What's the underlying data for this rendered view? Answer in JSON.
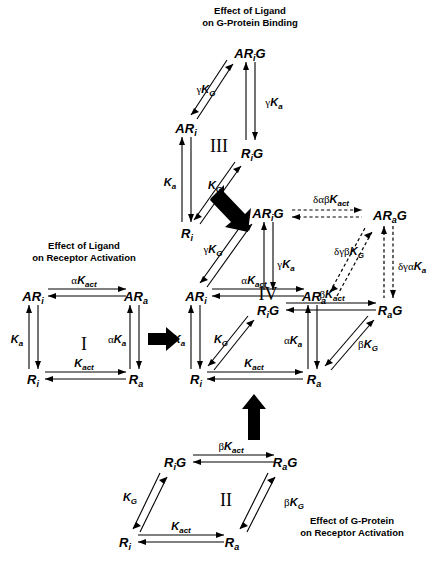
{
  "figure": {
    "captions": [
      {
        "id": "cap-ligand-gprotein",
        "lines": [
          "Effect of Ligand",
          "on G-Protein Binding"
        ],
        "x": 250,
        "y": 14
      },
      {
        "id": "cap-ligand-receptor",
        "lines": [
          "Effect of Ligand",
          "on Receptor Activation"
        ],
        "x": 84,
        "y": 249
      },
      {
        "id": "cap-gprotein-receptor",
        "lines": [
          "Effect of G-Protein",
          "on Receptor Activation"
        ],
        "x": 352,
        "y": 524
      }
    ],
    "scheme_labels": [
      {
        "id": "scheme-I",
        "text": "I",
        "x": 84,
        "y": 344
      },
      {
        "id": "scheme-II",
        "text": "II",
        "x": 226,
        "y": 500
      },
      {
        "id": "scheme-III",
        "text": "III",
        "x": 219,
        "y": 146
      },
      {
        "id": "scheme-IV",
        "text": "IV",
        "x": 268,
        "y": 297
      }
    ],
    "schemes": {
      "I": {
        "name": "Effect of Ligand on Receptor Activation",
        "nodes": [
          {
            "id": "I-ARi",
            "base": "AR",
            "sub": "i",
            "x": 33,
            "y": 296
          },
          {
            "id": "I-ARa",
            "base": "AR",
            "sub": "a",
            "x": 134,
            "y": 296
          },
          {
            "id": "I-Ri",
            "base": "R",
            "sub": "i",
            "x": 33,
            "y": 379
          },
          {
            "id": "I-Ra",
            "base": "R",
            "sub": "a",
            "x": 134,
            "y": 379
          }
        ],
        "edges": [
          {
            "id": "I-top",
            "label": {
              "greek": "α",
              "base": "K",
              "sub": "act"
            },
            "lx": 84,
            "ly": 283
          },
          {
            "id": "I-left",
            "label": {
              "greek": "",
              "base": "K",
              "sub": "a"
            },
            "lx": 19,
            "ly": 340
          },
          {
            "id": "I-right",
            "label": {
              "greek": "α",
              "base": "K",
              "sub": "a"
            },
            "lx": 116,
            "ly": 340
          },
          {
            "id": "I-bottom",
            "label": {
              "greek": "",
              "base": "K",
              "sub": "act"
            },
            "lx": 84,
            "ly": 366
          }
        ]
      },
      "II": {
        "name": "Effect of G-Protein on Receptor Activation",
        "nodes": [
          {
            "id": "II-RiG",
            "base": "R",
            "sub": "i",
            "post": "G",
            "x": 175,
            "y": 462
          },
          {
            "id": "II-RaG",
            "base": "R",
            "sub": "a",
            "post": "G",
            "x": 283,
            "y": 462
          },
          {
            "id": "II-Ri",
            "base": "R",
            "sub": "i",
            "x": 125,
            "y": 542
          },
          {
            "id": "II-Ra",
            "base": "R",
            "sub": "a",
            "x": 232,
            "y": 542
          }
        ],
        "edges": [
          {
            "id": "II-top",
            "label": {
              "greek": "β",
              "base": "K",
              "sub": "act"
            },
            "lx": 229,
            "ly": 449
          },
          {
            "id": "II-diag-left",
            "label": {
              "greek": "",
              "base": "K",
              "sub": "G"
            },
            "lx": 131,
            "ly": 498
          },
          {
            "id": "II-diag-right",
            "label": {
              "greek": "β",
              "base": "K",
              "sub": "G"
            },
            "lx": 292,
            "ly": 503
          },
          {
            "id": "II-bottom",
            "label": {
              "greek": "",
              "base": "K",
              "sub": "act"
            },
            "lx": 180,
            "ly": 529
          }
        ]
      },
      "III": {
        "name": "Effect of Ligand on G-Protein Binding",
        "nodes": [
          {
            "id": "III-ARiG",
            "base": "AR",
            "sub": "i",
            "post": "G",
            "x": 250,
            "y": 53
          },
          {
            "id": "III-ARi",
            "base": "AR",
            "sub": "i",
            "x": 186,
            "y": 128
          },
          {
            "id": "III-RiG",
            "base": "R",
            "sub": "i",
            "post": "G",
            "x": 252,
            "y": 153
          },
          {
            "id": "III-Ri",
            "base": "R",
            "sub": "i",
            "x": 187,
            "y": 233
          }
        ],
        "edges": [
          {
            "id": "III-diag-top",
            "label": {
              "greek": "γ",
              "base": "K",
              "sub": "G"
            },
            "lx": 206,
            "ly": 90
          },
          {
            "id": "III-right",
            "label": {
              "greek": "γ",
              "base": "K",
              "sub": "a"
            },
            "lx": 272,
            "ly": 103
          },
          {
            "id": "III-left",
            "label": {
              "greek": "",
              "base": "K",
              "sub": "a"
            },
            "lx": 172,
            "ly": 183
          },
          {
            "id": "III-diag-bottom",
            "label": {
              "greek": "",
              "base": "K",
              "sub": "G"
            },
            "lx": 213,
            "ly": 186
          }
        ]
      },
      "IV": {
        "name": "Cubic ternary complex model",
        "nodes": [
          {
            "id": "IV-ARiG",
            "base": "AR",
            "sub": "i",
            "post": "G",
            "x": 268,
            "y": 213
          },
          {
            "id": "IV-ARaG",
            "base": "AR",
            "sub": "a",
            "post": "G",
            "x": 388,
            "y": 215
          },
          {
            "id": "IV-ARi",
            "base": "AR",
            "sub": "i",
            "x": 195,
            "y": 296
          },
          {
            "id": "IV-ARa",
            "base": "AR",
            "sub": "a",
            "x": 312,
            "y": 296
          },
          {
            "id": "IV-RiG",
            "base": "R",
            "sub": "i",
            "post": "G",
            "x": 267,
            "y": 310
          },
          {
            "id": "IV-RaG",
            "base": "R",
            "sub": "a",
            "post": "G",
            "x": 388,
            "y": 310
          },
          {
            "id": "IV-Ri",
            "base": "R",
            "sub": "i",
            "x": 195,
            "y": 379
          },
          {
            "id": "IV-Ra",
            "base": "R",
            "sub": "a",
            "x": 312,
            "y": 379
          }
        ],
        "edges": [
          {
            "id": "IV-ARi-ARiG",
            "label": {
              "greek": "γ",
              "base": "K",
              "sub": "G"
            },
            "lx": 214,
            "ly": 250
          },
          {
            "id": "IV-ARiG-ARa-vert",
            "label": {
              "greek": "γ",
              "base": "K",
              "sub": "a"
            },
            "lx": 284,
            "ly": 265
          },
          {
            "id": "IV-ARi-ARa",
            "label": {
              "greek": "α",
              "base": "K",
              "sub": "act"
            },
            "lx": 254,
            "ly": 283
          },
          {
            "id": "IV-RiG-RaG",
            "label": {
              "greek": "β",
              "base": "K",
              "sub": "act"
            },
            "lx": 330,
            "ly": 297
          },
          {
            "id": "IV-ARi-Ri",
            "label": {
              "greek": "",
              "base": "K",
              "sub": "a"
            },
            "lx": 181,
            "ly": 340
          },
          {
            "id": "IV-Ri-RiG",
            "label": {
              "greek": "",
              "base": "K",
              "sub": "G"
            },
            "lx": 221,
            "ly": 340
          },
          {
            "id": "IV-ARa-Ra",
            "label": {
              "greek": "α",
              "base": "K",
              "sub": "a"
            },
            "lx": 292,
            "ly": 341
          },
          {
            "id": "IV-Ra-RaG",
            "label": {
              "greek": "β",
              "base": "K",
              "sub": "G"
            },
            "lx": 366,
            "ly": 345
          },
          {
            "id": "IV-Ri-Ra",
            "label": {
              "greek": "",
              "base": "K",
              "sub": "act"
            },
            "lx": 254,
            "ly": 366
          },
          {
            "id": "IV-ARiG-ARaG",
            "label": {
              "greek": "δαβ",
              "base": "K",
              "sub": "act"
            },
            "lx": 331,
            "ly": 202,
            "dashed": true
          },
          {
            "id": "IV-RaG-ARaG",
            "label": {
              "greek": "δγβ",
              "base": "K",
              "sub": "G"
            },
            "lx": 348,
            "ly": 252,
            "dashed": true
          },
          {
            "id": "IV-ARaG-RaG-vert",
            "label": {
              "greek": "δγα",
              "base": "K",
              "sub": "a"
            },
            "lx": 410,
            "ly": 267,
            "dashed": true
          }
        ]
      }
    },
    "block_arrows": [
      {
        "id": "block-arrow-I-to-IV",
        "direction": "right",
        "x": 152,
        "y": 338
      },
      {
        "id": "block-arrow-II-to-IV",
        "direction": "up",
        "x": 252,
        "y": 420
      },
      {
        "id": "block-arrow-III-to-IV",
        "direction": "down-right",
        "x": 222,
        "y": 210
      }
    ],
    "colors": {
      "ink": "#000000",
      "background": "#ffffff"
    }
  }
}
